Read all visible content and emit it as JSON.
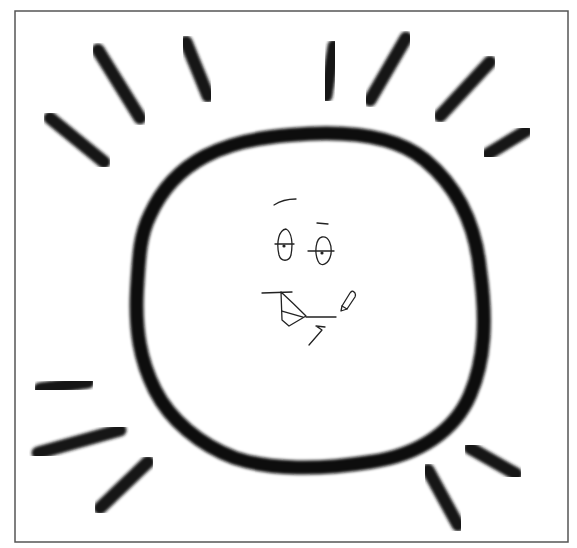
{
  "image": {
    "subject": "hand-drawn smiling sun with rays",
    "colors": {
      "background": "#ffffff",
      "ink": "#111111",
      "frame": "#555555"
    }
  },
  "frame": {
    "x": 15,
    "y": 11,
    "width": 553,
    "height": 531
  },
  "sun": {
    "outline_path": "M 150 215 C 175 160, 225 140, 290 135 C 345 130, 395 135, 425 160 C 455 185, 475 220, 480 270 C 487 320, 485 360, 470 395 C 455 430, 420 455, 370 462 C 320 470, 270 470, 235 458 C 200 445, 170 420, 155 390 C 140 360, 135 330, 137 290 C 139 255, 140 235, 150 215 Z"
  },
  "rays": [
    {
      "name": "ray-top-left-outer",
      "x1": 50,
      "y1": 118,
      "x2": 104,
      "y2": 162
    },
    {
      "name": "ray-top-left-mid",
      "x1": 98,
      "y1": 50,
      "x2": 140,
      "y2": 118
    },
    {
      "name": "ray-top-left-inner",
      "x1": 186,
      "y1": 42,
      "x2": 208,
      "y2": 96
    },
    {
      "name": "ray-top-center",
      "x1": 334,
      "y1": 46,
      "x2": 326,
      "y2": 96
    },
    {
      "name": "ray-top-right-inner",
      "x1": 406,
      "y1": 38,
      "x2": 370,
      "y2": 100
    },
    {
      "name": "ray-top-right-outer",
      "x1": 490,
      "y1": 62,
      "x2": 440,
      "y2": 116
    },
    {
      "name": "ray-right-upper",
      "x1": 526,
      "y1": 131,
      "x2": 488,
      "y2": 154
    },
    {
      "name": "ray-left-lower-short",
      "x1": 40,
      "y1": 389,
      "x2": 88,
      "y2": 382
    },
    {
      "name": "ray-left-lower-long",
      "x1": 38,
      "y1": 453,
      "x2": 120,
      "y2": 430
    },
    {
      "name": "ray-bottom-left",
      "x1": 100,
      "y1": 508,
      "x2": 148,
      "y2": 462
    },
    {
      "name": "ray-bottom-right",
      "x1": 428,
      "y1": 470,
      "x2": 458,
      "y2": 525
    },
    {
      "name": "ray-right-lower",
      "x1": 470,
      "y1": 448,
      "x2": 516,
      "y2": 474
    }
  ],
  "face": {
    "strokes": [
      {
        "name": "eyebrow-left",
        "d": "M 274 205 Q 283 199 296 199"
      },
      {
        "name": "eyebrow-right",
        "d": "M 317 223 L 328 224"
      },
      {
        "name": "eye-left-outline",
        "d": "M 286 229 C 279 230, 276 242, 279 255 C 281 262, 289 262, 291 255 C 293 244, 292 232, 286 229 Z"
      },
      {
        "name": "eye-left-crossbar",
        "d": "M 275 244 L 294 244"
      },
      {
        "name": "eye-right-outline",
        "d": "M 322 237 C 316 238, 314 252, 318 261 C 321 268, 329 264, 331 254 C 332 245, 329 236, 322 237 Z"
      },
      {
        "name": "eye-right-crossbar",
        "d": "M 308 251 L 334 251"
      },
      {
        "name": "mouth-top-line",
        "d": "M 262 293 L 292 292"
      },
      {
        "name": "mouth-shape",
        "d": "M 281 292 L 282 320 L 289 326 L 306 316 Q 293 303 281 292"
      },
      {
        "name": "mouth-inner-line",
        "d": "M 282 311 L 303 317"
      },
      {
        "name": "mouth-tail-line",
        "d": "M 306 317 L 336 317"
      },
      {
        "name": "chin-mark",
        "d": "M 309 345 L 322 330 L 316 326 M 316 326 L 325 327"
      },
      {
        "name": "pencil-cursor-outline",
        "d": "M 342 306 L 350 293 Q 352 290 354 292 L 355 293 Q 356 295 355 297 L 347 309 Z"
      },
      {
        "name": "pencil-cursor-tip",
        "d": "M 342 306 L 341 311 L 347 309"
      }
    ],
    "dots": [
      {
        "name": "pupil-left",
        "cx": 284,
        "cy": 246,
        "r": 1.6
      },
      {
        "name": "pupil-right",
        "cx": 322,
        "cy": 253,
        "r": 1.6
      }
    ]
  }
}
